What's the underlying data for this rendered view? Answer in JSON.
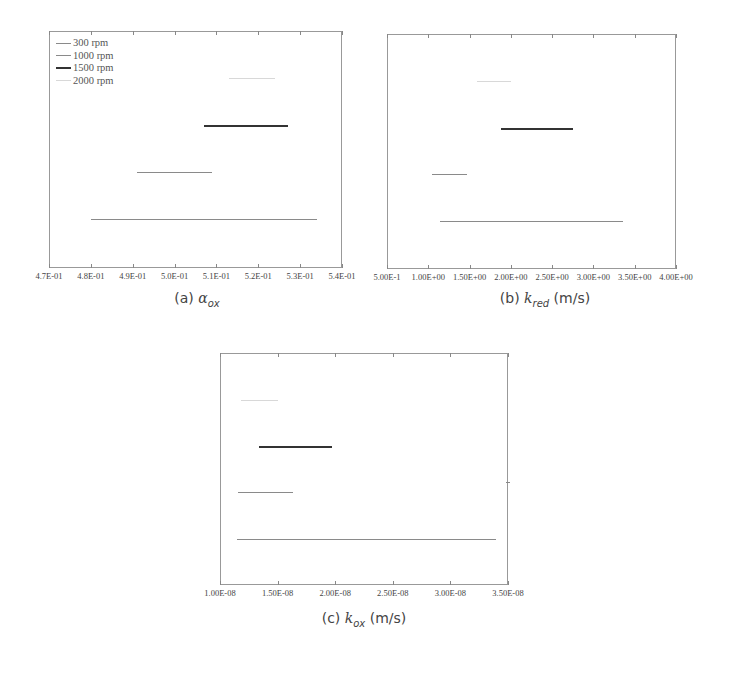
{
  "legend_labels": [
    "300 rpm",
    "1000 rpm",
    "1500 rpm",
    "2000 rpm"
  ],
  "series_styles": [
    {
      "name": "300 rpm",
      "color": "#8a8a8a",
      "width": 1.5
    },
    {
      "name": "1000 rpm",
      "color": "#8a8a8a",
      "width": 1.5
    },
    {
      "name": "1500 rpm",
      "color": "#333333",
      "width": 2.5
    },
    {
      "name": "2000 rpm",
      "color": "#d8d8d8",
      "width": 1
    }
  ],
  "captions": {
    "a": {
      "prefix": "(a)",
      "symbol": "α",
      "sub": "ox",
      "unit": ""
    },
    "b": {
      "prefix": "(b)",
      "symbol": "k",
      "sub": "red",
      "unit": "(m/s)"
    },
    "c": {
      "prefix": "(c)",
      "symbol": "k",
      "sub": "ox",
      "unit": "(m/s)"
    }
  },
  "chart_data": [
    {
      "type": "range-bar",
      "title": "(a) α_ox",
      "xlabel": "α_ox",
      "xlim": [
        0.47,
        0.54
      ],
      "ticks": [
        0.47,
        0.48,
        0.49,
        0.5,
        0.51,
        0.52,
        0.53,
        0.54
      ],
      "tick_labels": [
        "4.7E-01",
        "4.8E-01",
        "4.9E-01",
        "5.0E-01",
        "5.1E-01",
        "5.2E-01",
        "5.3E-01",
        "5.4E-01"
      ],
      "legend_position": "upper left",
      "series": [
        {
          "name": "300 rpm",
          "range": [
            0.48,
            0.534
          ]
        },
        {
          "name": "1000 rpm",
          "range": [
            0.491,
            0.509
          ]
        },
        {
          "name": "1500 rpm",
          "range": [
            0.507,
            0.527
          ]
        },
        {
          "name": "2000 rpm",
          "range": [
            0.513,
            0.524
          ]
        }
      ]
    },
    {
      "type": "range-bar",
      "title": "(b) k_red (m/s)",
      "xlabel": "k_red (m/s)",
      "xlim": [
        0.5,
        4.0
      ],
      "ticks": [
        0.5,
        1.0,
        1.5,
        2.0,
        2.5,
        3.0,
        3.5,
        4.0
      ],
      "tick_labels": [
        "5.00E-1",
        "1.00E+00",
        "1.50E+00",
        "2.00E+00",
        "2.50E+00",
        "3.00E+00",
        "3.50E+00",
        "4.00E+00"
      ],
      "legend_position": "upper right",
      "series": [
        {
          "name": "300 rpm",
          "range": [
            1.14,
            3.36
          ]
        },
        {
          "name": "1000 rpm",
          "range": [
            1.04,
            1.47
          ]
        },
        {
          "name": "1500 rpm",
          "range": [
            1.88,
            2.75
          ]
        },
        {
          "name": "2000 rpm",
          "range": [
            1.59,
            2.0
          ]
        }
      ]
    },
    {
      "type": "range-bar",
      "title": "(c) k_ox (m/s)",
      "xlabel": "k_ox (m/s)",
      "xlim": [
        1e-08,
        3.5e-08
      ],
      "ticks": [
        1e-08,
        1.5e-08,
        2e-08,
        2.5e-08,
        3e-08,
        3.5e-08
      ],
      "tick_labels": [
        "1.00E-08",
        "1.50E-08",
        "2.00E-08",
        "2.50E-08",
        "3.00E-08",
        "3.50E-08"
      ],
      "legend_position": "upper right",
      "series": [
        {
          "name": "300 rpm",
          "range": [
            1.15e-08,
            3.4e-08
          ]
        },
        {
          "name": "1000 rpm",
          "range": [
            1.16e-08,
            1.63e-08
          ]
        },
        {
          "name": "1500 rpm",
          "range": [
            1.34e-08,
            1.97e-08
          ]
        },
        {
          "name": "2000 rpm",
          "range": [
            1.18e-08,
            1.5e-08
          ]
        }
      ]
    }
  ]
}
